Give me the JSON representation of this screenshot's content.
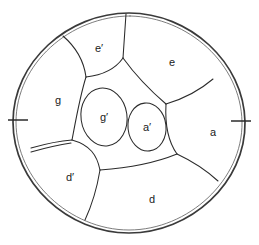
{
  "figure": {
    "background_color": "#ffffff",
    "stroke_color": "#2b2b2b",
    "boundary_stroke_color": "#3a3a3a",
    "label_color": "#1a1a1a",
    "regions": [
      {
        "id": "g",
        "label": "g",
        "x": 58,
        "y": 100
      },
      {
        "id": "e-prime",
        "label": "e′",
        "x": 99,
        "y": 48
      },
      {
        "id": "e",
        "label": "e",
        "x": 172,
        "y": 62
      },
      {
        "id": "a",
        "label": "a",
        "x": 213,
        "y": 132
      },
      {
        "id": "d",
        "label": "d",
        "x": 152,
        "y": 199
      },
      {
        "id": "d-prime",
        "label": "d′",
        "x": 70,
        "y": 177
      },
      {
        "id": "g-prime",
        "label": "g′",
        "x": 104,
        "y": 117
      },
      {
        "id": "a-prime",
        "label": "a′",
        "x": 147,
        "y": 127
      }
    ],
    "marks": [
      {
        "id": "tick-left",
        "description": "tick mark on left rim"
      },
      {
        "id": "tick-right",
        "description": "tick mark on right rim"
      },
      {
        "id": "double-line-lower-left",
        "description": "double boundary line from rim to junction"
      }
    ]
  }
}
